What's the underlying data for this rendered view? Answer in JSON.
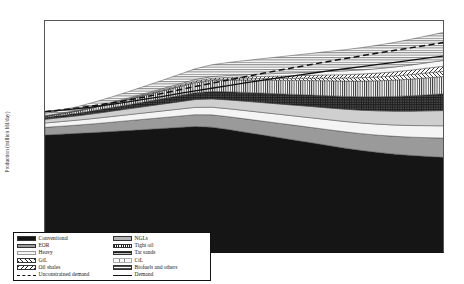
{
  "chart_data": {
    "type": "area",
    "title": "",
    "xlabel": "",
    "ylabel": "Production (million bbl/day)",
    "ylim": [
      0,
      140
    ],
    "yticks": [
      0,
      20,
      40,
      60,
      80,
      100,
      120,
      140
    ],
    "grid": false,
    "legend_position": "bottom-left-inside",
    "stacked": true,
    "x": [
      2007,
      2008,
      2009,
      2010,
      2011,
      2012,
      2013,
      2014,
      2015,
      2016,
      2017,
      2018,
      2019,
      2020,
      2021,
      2022,
      2023,
      2024,
      2025,
      2026,
      2027,
      2028,
      2029,
      2030,
      2031
    ],
    "xticklabels": [
      "2007",
      "2008",
      "2009",
      "2010",
      "2011",
      "2012",
      "2013",
      "2014",
      "2015",
      "2016",
      "2017",
      "2018",
      "2019",
      "2020",
      "2021",
      "2022",
      "2023",
      "2024",
      "2025",
      "2026",
      "2027",
      "2028",
      "2029",
      "2030",
      "2031"
    ],
    "series": [
      {
        "name": "Conventional",
        "kind": "area",
        "fill": "#151515",
        "values": [
          71.5,
          72.0,
          72.5,
          73.0,
          73.6,
          74.2,
          74.8,
          75.4,
          76.0,
          76.6,
          76.2,
          74.8,
          73.2,
          71.6,
          70.0,
          68.4,
          66.8,
          65.2,
          63.6,
          62.2,
          61.0,
          60.0,
          59.2,
          58.6,
          58.0
        ]
      },
      {
        "name": "EOR",
        "kind": "area",
        "fill": "#9a9a9a",
        "values": [
          4.6,
          4.8,
          5.0,
          5.3,
          5.6,
          5.9,
          6.2,
          6.5,
          6.8,
          7.1,
          7.4,
          7.7,
          8.0,
          8.3,
          8.6,
          8.9,
          9.2,
          9.5,
          9.8,
          10.1,
          10.4,
          10.7,
          11.0,
          11.3,
          11.6
        ]
      },
      {
        "name": "Heavy",
        "kind": "area",
        "fill": "#f2f2f2",
        "values": [
          2.6,
          2.8,
          3.0,
          3.2,
          3.4,
          3.6,
          3.8,
          4.0,
          4.2,
          4.4,
          4.6,
          4.8,
          5.0,
          5.2,
          5.4,
          5.6,
          5.8,
          6.0,
          6.2,
          6.4,
          6.6,
          6.8,
          7.0,
          7.2,
          7.4
        ]
      },
      {
        "name": "NGLs",
        "kind": "area",
        "fill": "#cfcfcf",
        "values": [
          2.2,
          2.4,
          2.6,
          2.9,
          3.2,
          3.5,
          3.8,
          4.1,
          4.4,
          4.7,
          5.0,
          5.3,
          5.6,
          5.9,
          6.2,
          6.5,
          6.8,
          7.1,
          7.4,
          7.7,
          8.0,
          8.3,
          8.6,
          8.9,
          9.2
        ]
      },
      {
        "name": "Tar sands",
        "kind": "area",
        "fill": "#262626",
        "values": [
          1.2,
          1.4,
          1.6,
          1.9,
          2.2,
          2.5,
          2.9,
          3.3,
          3.7,
          4.1,
          4.5,
          4.9,
          5.3,
          5.7,
          6.1,
          6.5,
          6.9,
          7.3,
          7.7,
          8.1,
          8.5,
          8.9,
          9.3,
          9.7,
          10.1
        ]
      },
      {
        "name": "Tight oil",
        "kind": "area",
        "fill": "#e8e8e8",
        "values": [
          0.6,
          0.9,
          1.3,
          1.8,
          2.4,
          3.1,
          3.8,
          4.5,
          5.2,
          5.9,
          6.5,
          7.0,
          7.4,
          7.8,
          8.1,
          8.4,
          8.7,
          9.0,
          9.2,
          9.4,
          9.6,
          9.8,
          10.0,
          10.2,
          10.4
        ]
      },
      {
        "name": "Oil shales",
        "kind": "area",
        "fill": "#dedede",
        "values": [
          0.05,
          0.06,
          0.08,
          0.1,
          0.13,
          0.17,
          0.22,
          0.28,
          0.36,
          0.45,
          0.56,
          0.68,
          0.82,
          0.97,
          1.13,
          1.3,
          1.48,
          1.67,
          1.87,
          2.08,
          2.3,
          2.52,
          2.75,
          2.98,
          3.22
        ]
      },
      {
        "name": "GtL",
        "kind": "area",
        "fill": "#e3e3e3",
        "values": [
          0.1,
          0.13,
          0.17,
          0.22,
          0.28,
          0.35,
          0.43,
          0.52,
          0.62,
          0.73,
          0.85,
          0.97,
          1.1,
          1.24,
          1.38,
          1.53,
          1.68,
          1.84,
          2.0,
          2.17,
          2.34,
          2.51,
          2.69,
          2.87,
          3.05
        ]
      },
      {
        "name": "CtL",
        "kind": "area",
        "fill": "#f6f6f6",
        "values": [
          0.15,
          0.18,
          0.23,
          0.29,
          0.36,
          0.44,
          0.53,
          0.63,
          0.74,
          0.86,
          0.99,
          1.13,
          1.28,
          1.43,
          1.59,
          1.76,
          1.93,
          2.11,
          2.29,
          2.48,
          2.67,
          2.87,
          3.07,
          3.27,
          3.48
        ]
      },
      {
        "name": "Biofuels and others",
        "kind": "area",
        "fill": "#ededed",
        "values": [
          1.5,
          1.8,
          2.2,
          2.7,
          3.2,
          3.8,
          4.4,
          5.0,
          5.7,
          6.4,
          7.1,
          7.8,
          8.5,
          9.2,
          9.9,
          10.6,
          11.3,
          12.0,
          12.7,
          13.4,
          14.1,
          14.8,
          15.5,
          16.2,
          16.9
        ]
      },
      {
        "name": "Demand",
        "kind": "line",
        "style": "solid",
        "color": "#111111",
        "values": [
          85.5,
          86.4,
          87.4,
          88.6,
          89.9,
          91.4,
          93.0,
          94.6,
          96.3,
          98.0,
          99.6,
          101.2,
          102.8,
          104.3,
          105.8,
          107.2,
          108.6,
          110.0,
          111.3,
          112.6,
          113.9,
          115.2,
          116.5,
          117.8,
          119.0
        ]
      },
      {
        "name": "Unconstrained demand",
        "kind": "line",
        "style": "dashed",
        "color": "#111111",
        "values": [
          85.5,
          86.6,
          87.8,
          89.2,
          90.8,
          92.5,
          94.4,
          96.4,
          98.5,
          100.6,
          102.6,
          104.6,
          106.5,
          108.4,
          110.3,
          112.1,
          113.9,
          115.7,
          117.4,
          119.1,
          120.8,
          122.4,
          124.0,
          125.6,
          127.2
        ]
      }
    ]
  },
  "axis": {
    "y_title": "Production (million bbl/day)",
    "y_tick_labels": [
      "0",
      "20",
      "40",
      "60",
      "80",
      "100",
      "120",
      "140"
    ]
  },
  "legend": {
    "column_left": [
      {
        "label": "Conventional",
        "swatch": "solid-black-swatch"
      },
      {
        "label": "EOR",
        "swatch": "solid-lightgray-swatch"
      },
      {
        "label": "Heavy",
        "swatch": "solid-verylight-swatch"
      },
      {
        "label": "GtL",
        "swatch": "diagonal-hatch-swatch"
      },
      {
        "label": "Oil shales",
        "swatch": "cross-hatch-swatch"
      },
      {
        "label": "Unconstrained demand",
        "swatch": "dashed-line-swatch"
      }
    ],
    "column_right": [
      {
        "label": "NGLs",
        "swatch": "solid-gray-swatch"
      },
      {
        "label": "Tight oil",
        "swatch": "vertical-line-swatch"
      },
      {
        "label": "Tar sands",
        "swatch": "dark-dotted-swatch"
      },
      {
        "label": "CtL",
        "swatch": "fine-dot-swatch"
      },
      {
        "label": "Biofuels and others",
        "swatch": "horizontal-line-swatch"
      },
      {
        "label": "Demand",
        "swatch": "solid-line-swatch"
      }
    ]
  }
}
